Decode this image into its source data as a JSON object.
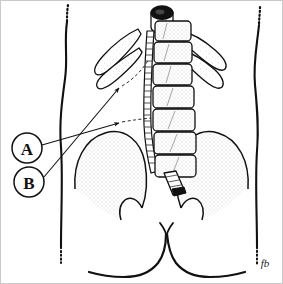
{
  "figure": {
    "view": "posterior-anatomical-line-drawing",
    "background_color": "#ffffff",
    "ink_color": "#111111",
    "stipple_color": "#8a8a8a",
    "border_color": "#c9c9c9",
    "signature": "fb"
  },
  "labels": [
    {
      "id": "A",
      "letter": "A",
      "circle": {
        "cx": 26,
        "cy": 147,
        "r": 15
      },
      "leader": {
        "from_x": 41,
        "from_y": 143,
        "to_x": 121,
        "to_y": 122
      },
      "points_to": "lumbar-vertebral-body-region"
    },
    {
      "id": "B",
      "letter": "B",
      "circle": {
        "cx": 28,
        "cy": 181,
        "r": 15
      },
      "leader": {
        "from_x": 43,
        "from_y": 176,
        "to_x": 120,
        "to_y": 86
      },
      "points_to": "transverse-process-rib-region"
    }
  ],
  "anatomy": {
    "spinal_cord_top_label": "dural-sac-cross-section",
    "vertebral_body_count": 7,
    "rib_pairs": 2,
    "iliac_crest_count": 2,
    "sacrum_label": "sacral-terminus",
    "gluteal_cleft_label": "gluteal-cleft"
  },
  "geometry": {
    "torso_left_outline": "M 66,20 C 63,40 67,58 64,78 C 61,100 58,122 60,146 C 62,178 60,212 60,252",
    "torso_left_dots": "M 67,6 C 66,11 66,15 66,20",
    "torso_right_outline": "M 258,24 C 256,44 252,62 254,84 C 256,106 258,126 256,150 C 254,182 256,214 256,250",
    "torso_right_dots": "M 259,8 C 259,13 258,19 258,24",
    "gluteal_cleft": "M 165,224 C 162,232 166,240 166,248 C 166,258 163,266 158,272 C 150,280 138,281 126,279 C 112,277 100,273 92,270",
    "gluteal_cleft_right": "M 165,224 C 168,232 169,240 170,248 C 171,258 175,266 181,272 C 190,280 202,281 214,279 C 226,277 236,273 243,270",
    "gluteal_cleft_notch": "M 160,222 C 163,226 164,229 165,232 C 166,229 168,226 171,222",
    "iliac_left_outline": "M 76,152 C 80,132 96,122 112,125 C 128,128 136,142 138,158 C 140,172 139,182 137,190 C 135,186 130,183 126,184 C 122,185 120,189 120,193",
    "iliac_right_outline": "M 245,152 C 241,132 225,122 209,125 C 193,128 185,142 183,158 C 181,172 182,182 184,190 C 186,186 191,183 195,184 C 199,185 201,189 201,193"
  }
}
